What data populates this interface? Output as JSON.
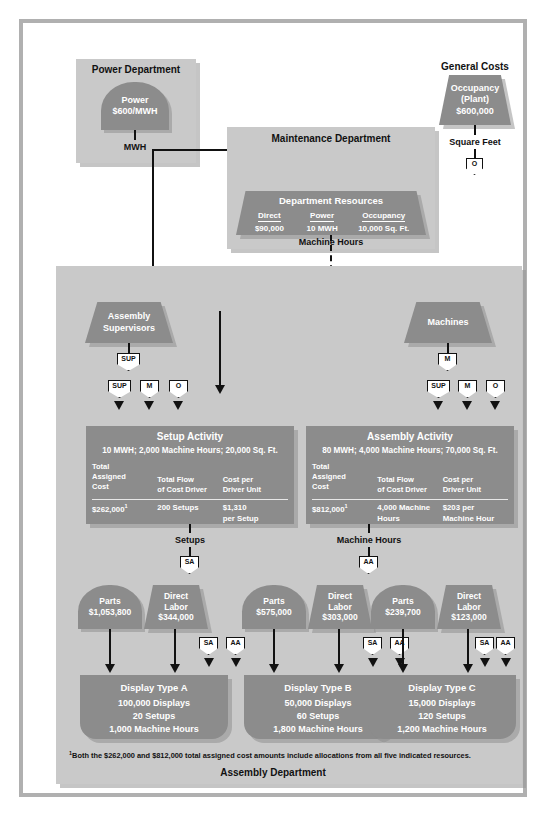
{
  "diagram": {
    "power_department": {
      "title": "Power Department",
      "resource": {
        "name": "Power",
        "rate": "$600/MWH"
      },
      "driver_label": "MWH"
    },
    "general_costs": {
      "title": "General Costs",
      "resource": {
        "name": "Occupancy",
        "qualifier": "(Plant)",
        "amount": "$600,000"
      },
      "driver_label": "Square Feet",
      "badge": "O"
    },
    "maintenance_department": {
      "title": "Maintenance Department",
      "resources_title": "Department Resources",
      "badge": "O",
      "columns": [
        {
          "header": "Direct",
          "value": "$90,000"
        },
        {
          "header": "Power",
          "value": "10 MWH"
        },
        {
          "header": "Occupancy",
          "value": "10,000 Sq. Ft."
        }
      ],
      "driver_label": "Machine Hours"
    },
    "assembly_department": {
      "label": "Assembly Department",
      "resources": [
        {
          "name": "Assembly",
          "name2": "Supervisors",
          "badge": "SUP"
        },
        {
          "name": "Machines",
          "name2": "",
          "badge": "M"
        }
      ],
      "input_badges": [
        "SUP",
        "M",
        "O"
      ],
      "activities": [
        {
          "title": "Setup Activity",
          "subtitle": "10 MWH; 2,000 Machine Hours; 20,000 Sq. Ft.",
          "col_headers": [
            "Total Assigned Cost",
            "Total Flow of Cost Driver",
            "Cost per Driver Unit"
          ],
          "col_header_lines": [
            [
              "Total",
              "Assigned",
              "Cost"
            ],
            [
              "Total Flow",
              "of Cost Driver",
              ""
            ],
            [
              "Cost per",
              "Driver Unit",
              ""
            ]
          ],
          "values": [
            "$262,000",
            "200 Setups",
            "$1,310 per Setup"
          ],
          "value_lines": [
            [
              "$262,000",
              ""
            ],
            [
              "200 Setups",
              ""
            ],
            [
              "$1,310",
              "per Setup"
            ]
          ],
          "footnote_marker": "1",
          "driver_label": "Setups",
          "driver_badge": "SA"
        },
        {
          "title": "Assembly Activity",
          "subtitle": "80 MWH; 4,000 Machine Hours; 70,000 Sq. Ft.",
          "col_headers": [
            "Total Assigned Cost",
            "Total Flow of Cost Driver",
            "Cost per Driver Unit"
          ],
          "col_header_lines": [
            [
              "Total",
              "Assigned",
              "Cost"
            ],
            [
              "Total Flow",
              "of Cost Driver",
              ""
            ],
            [
              "Cost per",
              "Driver Unit",
              ""
            ]
          ],
          "values": [
            "$812,000",
            "4,000 Machine Hours",
            "$203 per Machine Hour"
          ],
          "value_lines": [
            [
              "$812,000",
              ""
            ],
            [
              "4,000 Machine",
              "Hours"
            ],
            [
              "$203 per",
              "Machine Hour"
            ]
          ],
          "footnote_marker": "1",
          "driver_label": "Machine Hours",
          "driver_badge": "AA"
        }
      ],
      "product_groups": [
        {
          "parts": {
            "name": "Parts",
            "amount": "$1,053,800"
          },
          "labor": {
            "name": "Direct",
            "name2": "Labor",
            "amount": "$344,000"
          },
          "badges": [
            "SA",
            "AA"
          ],
          "product": {
            "title": "Display Type A",
            "lines": [
              "100,000 Displays",
              "20 Setups",
              "1,000 Machine Hours"
            ]
          }
        },
        {
          "parts": {
            "name": "Parts",
            "amount": "$575,000"
          },
          "labor": {
            "name": "Direct",
            "name2": "Labor",
            "amount": "$303,000"
          },
          "badges": [
            "SA",
            "AA"
          ],
          "product": {
            "title": "Display Type B",
            "lines": [
              "50,000 Displays",
              "60 Setups",
              "1,800 Machine Hours"
            ]
          }
        },
        {
          "parts": {
            "name": "Parts",
            "amount": "$239,700"
          },
          "labor": {
            "name": "Direct",
            "name2": "Labor",
            "amount": "$123,000"
          },
          "badges": [
            "SA",
            "AA"
          ],
          "product": {
            "title": "Display Type C",
            "lines": [
              "15,000 Displays",
              "120 Setups",
              "1,200 Machine Hours"
            ]
          }
        }
      ],
      "footnote": "Both the $262,000 and $812,000 total assigned cost amounts include allocations from all five indicated resources.",
      "footnote_marker": "1"
    },
    "colors": {
      "panel": "#c9c9c9",
      "shape": "#8c8c8c",
      "line": "#111111",
      "frame": "#b0b0b0",
      "background": "#ffffff"
    }
  }
}
